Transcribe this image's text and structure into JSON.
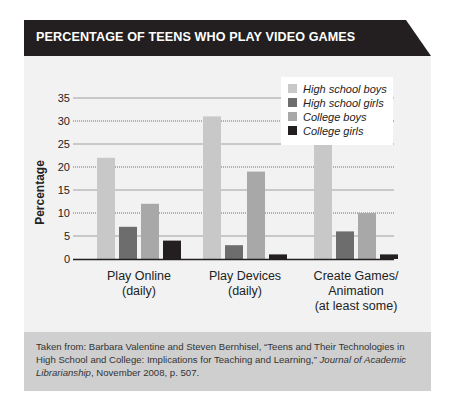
{
  "chart_data": {
    "type": "bar",
    "title": "PERCENTAGE OF TEENS WHO PLAY VIDEO GAMES",
    "xlabel": "",
    "ylabel": "Percentage",
    "ylim": [
      0,
      35
    ],
    "yticks": [
      0,
      5,
      10,
      15,
      20,
      25,
      30,
      35
    ],
    "grid": true,
    "legend_position": "top-right",
    "categories": [
      [
        "Play Online",
        "(daily)"
      ],
      [
        "Play Devices",
        "(daily)"
      ],
      [
        "Create Games/",
        "Animation",
        "(at least some)"
      ]
    ],
    "series": [
      {
        "name": "High school boys",
        "color": "#c8c8c8",
        "values": [
          22,
          31,
          25
        ]
      },
      {
        "name": "High school girls",
        "color": "#6d6d6d",
        "values": [
          7,
          3,
          6
        ]
      },
      {
        "name": "College boys",
        "color": "#a8a8a8",
        "values": [
          12,
          19,
          10
        ]
      },
      {
        "name": "College girls",
        "color": "#231f20",
        "values": [
          4,
          1,
          1
        ]
      }
    ]
  },
  "colors": {
    "title_bar": "#231f20",
    "chart_background": "#f2f2f2",
    "footer_background": "#cfcfcf"
  },
  "footer": {
    "prefix": "Taken from: Barbara Valentine and Steven Bernhisel, “Teens and Their Technologies in High School and College: Implications for Teaching and Learning,” ",
    "journal": "Journal of Academic Librarianship",
    "suffix": ", November 2008, p. 507."
  }
}
